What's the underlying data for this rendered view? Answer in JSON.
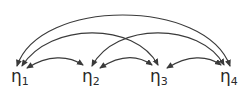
{
  "diagram": {
    "type": "path-diagram-covariances",
    "stroke_color": "#3a3a3a",
    "nodes": [
      {
        "id": "eta1",
        "symbol": "η",
        "subscript": "1",
        "x": 11,
        "y": 68
      },
      {
        "id": "eta2",
        "symbol": "η",
        "subscript": "2",
        "x": 82,
        "y": 68
      },
      {
        "id": "eta3",
        "symbol": "η",
        "subscript": "3",
        "x": 150,
        "y": 68
      },
      {
        "id": "eta4",
        "symbol": "η",
        "subscript": "4",
        "x": 220,
        "y": 68
      }
    ],
    "edges": [
      {
        "from": "eta1",
        "to": "eta4",
        "type": "double-headed-curved",
        "d": "M17,66 C40,-2 205,-2 230,66"
      },
      {
        "from": "eta1",
        "to": "eta3",
        "type": "double-headed-curved",
        "d": "M22,66 C50,22 135,22 158,65"
      },
      {
        "from": "eta2",
        "to": "eta4",
        "type": "double-headed-curved",
        "d": "M92,66 C115,22 200,22 224,65"
      },
      {
        "from": "eta1",
        "to": "eta2",
        "type": "double-headed-curved",
        "d": "M27,68 C48,55 68,55 83,65"
      },
      {
        "from": "eta2",
        "to": "eta3",
        "type": "double-headed-curved",
        "d": "M100,68 C120,55 138,55 152,65"
      },
      {
        "from": "eta3",
        "to": "eta4",
        "type": "double-headed-curved",
        "d": "M167,68 C188,55 207,55 221,65"
      }
    ]
  }
}
